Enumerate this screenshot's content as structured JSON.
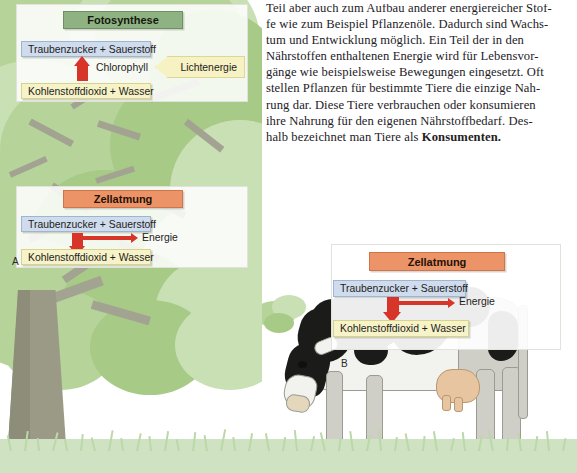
{
  "page": {
    "language": "de"
  },
  "body_text": {
    "lines": [
      "Teil aber auch zum Aufbau anderer energiereicher Stof-",
      "fe wie zum Beispiel Pflanzenöle. Dadurch sind Wachs-",
      "tum und Entwicklung möglich. Ein Teil der in den",
      "Nährstoffen enthaltenen Energie wird für Lebensvor-",
      "gänge wie beispielsweise Bewegungen eingesetzt. Oft",
      "stellen Pflanzen für bestimmte Tiere die einzige Nah-",
      "rung dar. Diese Tiere verbrauchen oder konsumieren",
      "ihre Nahrung für den eigenen Nährstoffbedarf. Des-",
      "halb bezeichnet man Tiere als "
    ],
    "bold_term": "Konsumenten.",
    "full_text": "Teil aber auch zum Aufbau anderer energiereicher Stoffe wie zum Beispiel Pflanzenöle. Dadurch sind Wachstum und Entwicklung möglich. Ein Teil der in den Nährstoffen enthaltenen Energie wird für Lebensvorgänge wie beispielsweise Bewegungen eingesetzt. Oft stellen Pflanzen für bestimmte Tiere die einzige Nahrung dar. Diese Tiere verbrauchen oder konsumieren ihre Nahrung für den eigenen Nährstoffbedarf. Deshalb bezeichnet man Tiere als Konsumenten."
  },
  "diagram_photosynthesis": {
    "figure_label": "",
    "title": "Fotosynthese",
    "product_box": "Traubenzucker + Sauerstoff",
    "educt_box": "Kohlenstoffdioxid + Wasser",
    "catalyst_label": "Chlorophyll",
    "energy_input": "Lichtenergie",
    "arrow_direction": "up",
    "colors": {
      "title_bg": "#8fb283",
      "title_border": "#6e8f63",
      "product_bg": "#cfdcee",
      "educt_bg": "#f6f3c8",
      "arrow": "#d7342a",
      "light_bg": "#f7f2c4"
    }
  },
  "diagram_respiration_plant": {
    "figure_label": "A",
    "title": "Zellatmung",
    "educt_box": "Traubenzucker + Sauerstoff",
    "product_box": "Kohlenstoffdioxid + Wasser",
    "energy_output": "Energie",
    "arrow_direction": "down",
    "colors": {
      "title_bg": "#ed9368",
      "title_border": "#cf7549",
      "educt_bg": "#cfdcee",
      "product_bg": "#f6f3c8",
      "arrow": "#d7342a"
    }
  },
  "diagram_respiration_animal": {
    "figure_label": "B",
    "title": "Zellatmung",
    "educt_box": "Traubenzucker + Sauerstoff",
    "product_box": "Kohlenstoffdioxid + Wasser",
    "energy_output": "Energie",
    "arrow_direction": "down",
    "colors": {
      "title_bg": "#ed9368",
      "title_border": "#cf7549",
      "educt_bg": "#cfdcee",
      "product_bg": "#f6f3c8",
      "arrow": "#d7342a"
    }
  },
  "illustration_left": {
    "subject": "tree",
    "canopy_color": "#b6d49a",
    "trunk_color": "#9a9a86",
    "grass_color": "#cfe3c2"
  },
  "illustration_cow": {
    "subject": "grazing-holstein-cow",
    "patch_color": "#1b1b19",
    "hide_color": "#f2f2ee",
    "udder_color": "#e6c5a0",
    "grass_color": "#cfe3c2"
  }
}
